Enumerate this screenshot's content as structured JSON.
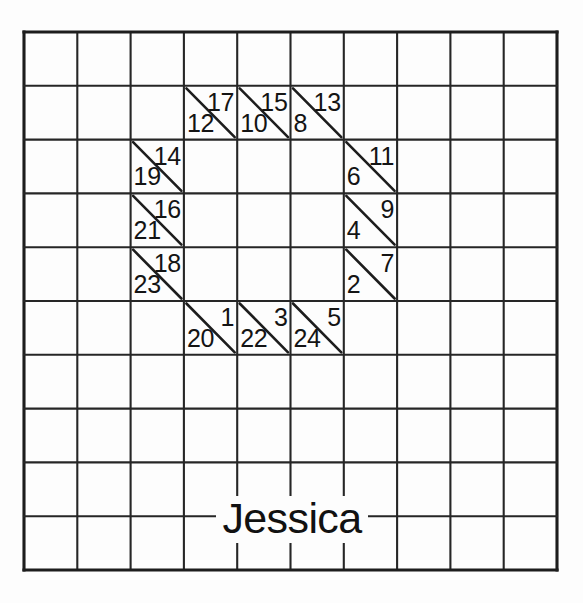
{
  "page": {
    "background_color": "#fdfdfd",
    "line_color": "#262626",
    "text_color": "#141414"
  },
  "grid": {
    "columns": 10,
    "rows": 10,
    "origin_x": 24,
    "origin_y": 32,
    "cell_width": 53.3,
    "cell_height": 53.8,
    "border_style": "outer-border-heavier"
  },
  "diagonal_cells": [
    {
      "id": "cell-r1-c3",
      "row": 1,
      "col": 3,
      "upper_right": "17",
      "lower_left": "12"
    },
    {
      "id": "cell-r1-c4",
      "row": 1,
      "col": 4,
      "upper_right": "15",
      "lower_left": "10"
    },
    {
      "id": "cell-r1-c5",
      "row": 1,
      "col": 5,
      "upper_right": "13",
      "lower_left": "8"
    },
    {
      "id": "cell-r2-c2",
      "row": 2,
      "col": 2,
      "upper_right": "14",
      "lower_left": "19"
    },
    {
      "id": "cell-r2-c6",
      "row": 2,
      "col": 6,
      "upper_right": "11",
      "lower_left": "6"
    },
    {
      "id": "cell-r3-c2",
      "row": 3,
      "col": 2,
      "upper_right": "16",
      "lower_left": "21"
    },
    {
      "id": "cell-r3-c6",
      "row": 3,
      "col": 6,
      "upper_right": "9",
      "lower_left": "4"
    },
    {
      "id": "cell-r4-c2",
      "row": 4,
      "col": 2,
      "upper_right": "18",
      "lower_left": "23"
    },
    {
      "id": "cell-r4-c6",
      "row": 4,
      "col": 6,
      "upper_right": "7",
      "lower_left": "2"
    },
    {
      "id": "cell-r5-c3",
      "row": 5,
      "col": 3,
      "upper_right": "1",
      "lower_left": "20"
    },
    {
      "id": "cell-r5-c4",
      "row": 5,
      "col": 4,
      "upper_right": "3",
      "lower_left": "22"
    },
    {
      "id": "cell-r5-c5",
      "row": 5,
      "col": 5,
      "upper_right": "5",
      "lower_left": "24"
    }
  ],
  "name_label": {
    "text": "Jessica",
    "center_x": 292,
    "center_y": 519
  }
}
